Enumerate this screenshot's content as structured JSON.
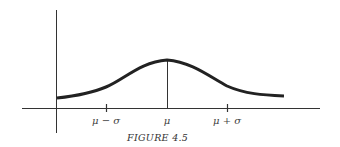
{
  "figure": {
    "caption": "FIGURE 4.5",
    "type": "normal distribution curve",
    "tick_labels": {
      "minus_sigma": "μ − σ",
      "mean": "μ",
      "plus_sigma": "μ + σ"
    },
    "colors": {
      "curve": "#222222",
      "axes": "#333333",
      "background": "#ffffff"
    }
  }
}
